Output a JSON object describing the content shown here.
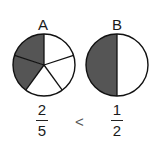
{
  "figures": [
    {
      "label": "A",
      "parts": 5,
      "shaded": 2,
      "numerator": "2",
      "denominator": "5"
    },
    {
      "label": "B",
      "parts": 2,
      "shaded": 1,
      "numerator": "1",
      "denominator": "2"
    }
  ],
  "comparison": "<",
  "colors": {
    "shade": "#555555",
    "stroke": "#111111",
    "fill": "#ffffff"
  }
}
